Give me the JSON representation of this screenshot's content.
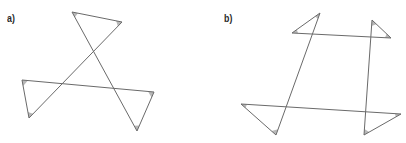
{
  "figures": [
    {
      "label": "a)",
      "vertices": {
        "A": [
          72,
          12
        ],
        "B": [
          122,
          22
        ],
        "C": [
          22,
          80
        ],
        "D": [
          29,
          118
        ],
        "E": [
          154,
          92
        ],
        "F": [
          137,
          131
        ]
      },
      "segments": [
        [
          "A",
          "F"
        ],
        [
          "A",
          "B"
        ],
        [
          "B",
          "D"
        ],
        [
          "C",
          "D"
        ],
        [
          "C",
          "E"
        ],
        [
          "E",
          "F"
        ]
      ],
      "marked_angles": [
        "A",
        "B",
        "C",
        "D",
        "E",
        "F"
      ]
    },
    {
      "label": "b)",
      "vertices": {
        "A": [
          292,
          33
        ],
        "B": [
          320,
          13
        ],
        "C": [
          372,
          20
        ],
        "D": [
          391,
          38
        ],
        "E": [
          241,
          104
        ],
        "F": [
          276,
          135
        ],
        "G": [
          401,
          114
        ],
        "H": [
          364,
          135
        ]
      },
      "segments": [
        [
          "A",
          "D"
        ],
        [
          "A",
          "B"
        ],
        [
          "B",
          "F"
        ],
        [
          "E",
          "F"
        ],
        [
          "E",
          "G"
        ],
        [
          "G",
          "H"
        ],
        [
          "C",
          "D"
        ],
        [
          "C",
          "H"
        ]
      ],
      "marked_angles": [
        "A",
        "B",
        "C",
        "D",
        "E",
        "F",
        "G",
        "H"
      ]
    }
  ],
  "colors": {
    "stroke": "#6a6a6a",
    "angle_fill": "#b8b8b8",
    "background": "#ffffff"
  }
}
